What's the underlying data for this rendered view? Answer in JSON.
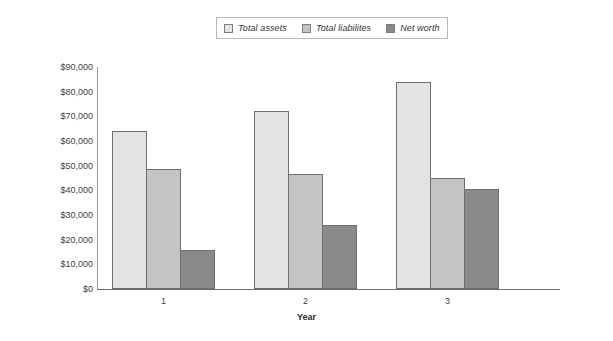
{
  "chart_data": {
    "type": "bar",
    "title": "",
    "xlabel": "Year",
    "ylabel": "",
    "categories": [
      "1",
      "2",
      "3"
    ],
    "series": [
      {
        "name": "Total assets",
        "values": [
          64000,
          72000,
          84000
        ],
        "color": "#e3e3e3"
      },
      {
        "name": "Total liabilites",
        "values": [
          48500,
          46500,
          45000
        ],
        "color": "#c4c4c4"
      },
      {
        "name": "Net worth",
        "values": [
          16000,
          26000,
          40500
        ],
        "color": "#8a8a8a"
      }
    ],
    "ylim": [
      0,
      90000
    ],
    "ytick_step": 10000,
    "ytick_labels": [
      "$90,000",
      "$80,000",
      "$70,000",
      "$60,000",
      "$50,000",
      "$40,000",
      "$30,000",
      "$20,000",
      "$10,000",
      "$0"
    ],
    "ytick_values": [
      90000,
      80000,
      70000,
      60000,
      50000,
      40000,
      30000,
      20000,
      10000,
      0
    ],
    "grid": false,
    "legend_position": "top-center",
    "bar_border_color": "#6f6f6f",
    "axis_color": "#8d8d8d"
  }
}
